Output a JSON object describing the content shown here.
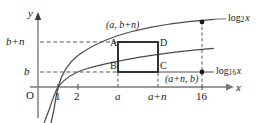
{
  "figure": {
    "type": "math-diagram",
    "axes": {
      "x_axis_label": "x",
      "y_axis_label": "y",
      "origin_label": "O"
    },
    "x_ticks": [
      "1",
      "2",
      "a",
      "a+n",
      "16"
    ],
    "y_ticks": [
      "b",
      "b+n"
    ],
    "curves": [
      {
        "id": "log2",
        "label_base": "log",
        "label_sub": "2",
        "label_arg": "x"
      },
      {
        "id": "log16",
        "label_base": "log",
        "label_sub": "16",
        "label_arg": "x"
      }
    ],
    "rectangle": {
      "corner_top_left": "A",
      "corner_bottom_left": "B",
      "corner_bottom_right": "C",
      "corner_top_right": "D"
    },
    "point_labels": {
      "top": "(a, b+n)",
      "right": "(a+n, b)"
    },
    "colors": {
      "curve": "#3a3a3a",
      "axis": "#6e6e6e",
      "rect": "#2b2b2b",
      "dash": "#4a4a4a",
      "text": "#1a1a1a"
    }
  }
}
